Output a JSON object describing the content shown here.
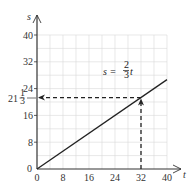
{
  "chart_data": {
    "type": "line",
    "title": "",
    "xlabel": "t",
    "ylabel": "s",
    "xlim": [
      0,
      40
    ],
    "ylim": [
      0,
      40
    ],
    "grid": true,
    "x_ticks": [
      0,
      8,
      16,
      24,
      32,
      40
    ],
    "y_ticks": [
      0,
      8,
      16,
      24,
      32,
      40
    ],
    "x_tick_labels": [
      "0",
      "8",
      "16",
      "24",
      "32",
      "40"
    ],
    "y_tick_labels": [
      "0",
      "8",
      "16",
      "24",
      "32",
      "40"
    ],
    "series": [
      {
        "name": "s = (2/3)t",
        "x": [
          0,
          40
        ],
        "y": [
          0,
          26.67
        ]
      }
    ],
    "annotations": [
      {
        "text": "s = 2/3 t",
        "type": "equation-label",
        "x": 27,
        "y": 26
      },
      {
        "text": "21 1/3",
        "type": "y-value-label",
        "y": 21.333
      },
      {
        "type": "dashed-arrow-vertical",
        "from": [
          32,
          0
        ],
        "to": [
          32,
          21.333
        ]
      },
      {
        "type": "dashed-arrow-horizontal",
        "from": [
          32,
          21.333
        ],
        "to": [
          0,
          21.333
        ]
      }
    ],
    "colors": {
      "line": "#222222",
      "grid": "#d9d9d9",
      "axis": "#333333"
    }
  },
  "labels": {
    "x_axis": "t",
    "y_axis": "s",
    "formula_lhs": "s =",
    "formula_num": "2",
    "formula_den": "3",
    "formula_var": "t",
    "highlight_whole": "21",
    "highlight_num": "1",
    "highlight_den": "3",
    "origin_y": "0",
    "ticks_x": [
      "0",
      "8",
      "16",
      "24",
      "32",
      "40"
    ],
    "ticks_y": [
      "8",
      "16",
      "24",
      "32",
      "40"
    ]
  }
}
